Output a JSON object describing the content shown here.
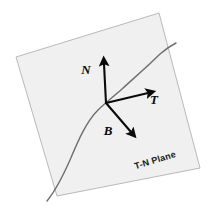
{
  "figure": {
    "background_color": "#ffffff"
  },
  "plane": {
    "caption": "T-N Plane",
    "fill_color": "#f0f0f0",
    "edge_color": "#b9b9b9",
    "corners": [
      {
        "x": 16,
        "y": 57
      },
      {
        "x": 159,
        "y": 13
      },
      {
        "x": 200,
        "y": 168
      },
      {
        "x": 57,
        "y": 196
      }
    ],
    "caption_position": {
      "x": 156,
      "y": 163
    },
    "caption_rotation_deg": -17
  },
  "curve": {
    "name": "space-curve",
    "color": "#6e6e6e",
    "stroke_width": 1.4,
    "path": "M 47 201 C 56 190 62 178 70 160 C 78 141 86 122 98 110 C 106 102 113 97 122 89 C 134 78 148 66 160 54 C 168 47 172 45 176 43"
  },
  "origin": {
    "name": "frame-origin",
    "x": 106,
    "y": 103
  },
  "vectors": [
    {
      "id": "N",
      "label": "N",
      "name": "normal-vector",
      "color": "#0a0a0a",
      "stroke_width": 2.1,
      "tip": {
        "x": 104,
        "y": 64
      },
      "label_position": {
        "x": 86,
        "y": 74
      }
    },
    {
      "id": "T",
      "label": "T",
      "name": "tangent-vector",
      "color": "#0a0a0a",
      "stroke_width": 2.1,
      "tip": {
        "x": 148,
        "y": 93
      },
      "label_position": {
        "x": 154,
        "y": 104
      }
    },
    {
      "id": "B",
      "label": "B",
      "name": "binormal-vector",
      "color": "#0a0a0a",
      "stroke_width": 2.1,
      "tip": {
        "x": 131,
        "y": 132
      },
      "label_position": {
        "x": 108,
        "y": 135
      }
    }
  ]
}
